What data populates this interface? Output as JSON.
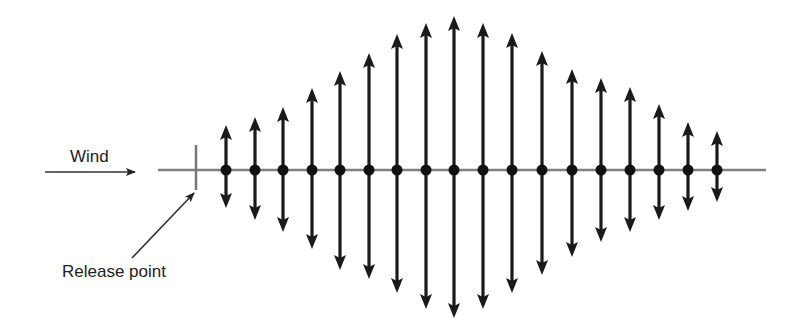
{
  "diagram": {
    "labels": {
      "wind": "Wind",
      "release_point": "Release point"
    },
    "colors": {
      "arrow": "#1a1a1a",
      "baseline": "#808080",
      "text": "#222222"
    },
    "baseline": {
      "x1": 158,
      "x2": 766,
      "y": 170
    },
    "release_marker": {
      "x": 196,
      "y1": 145,
      "y2": 190
    },
    "wind_arrow": {
      "x1": 45,
      "x2": 135,
      "y": 172
    },
    "release_pointer": {
      "x1": 132,
      "y1": 258,
      "x2": 194,
      "y2": 193
    },
    "oscillation_arrows": [
      {
        "x": 226,
        "top": 125,
        "bottom": 208
      },
      {
        "x": 255,
        "top": 117,
        "bottom": 220
      },
      {
        "x": 283,
        "top": 107,
        "bottom": 232
      },
      {
        "x": 312,
        "top": 88,
        "bottom": 249
      },
      {
        "x": 340,
        "top": 71,
        "bottom": 270
      },
      {
        "x": 369,
        "top": 53,
        "bottom": 279
      },
      {
        "x": 397,
        "top": 34,
        "bottom": 293
      },
      {
        "x": 426,
        "top": 23,
        "bottom": 309
      },
      {
        "x": 454,
        "top": 16,
        "bottom": 318
      },
      {
        "x": 483,
        "top": 23,
        "bottom": 309
      },
      {
        "x": 512,
        "top": 33,
        "bottom": 293
      },
      {
        "x": 542,
        "top": 51,
        "bottom": 275
      },
      {
        "x": 572,
        "top": 69,
        "bottom": 257
      },
      {
        "x": 601,
        "top": 78,
        "bottom": 242
      },
      {
        "x": 630,
        "top": 87,
        "bottom": 232
      },
      {
        "x": 659,
        "top": 104,
        "bottom": 220
      },
      {
        "x": 688,
        "top": 122,
        "bottom": 211
      },
      {
        "x": 717,
        "top": 131,
        "bottom": 202
      }
    ]
  }
}
